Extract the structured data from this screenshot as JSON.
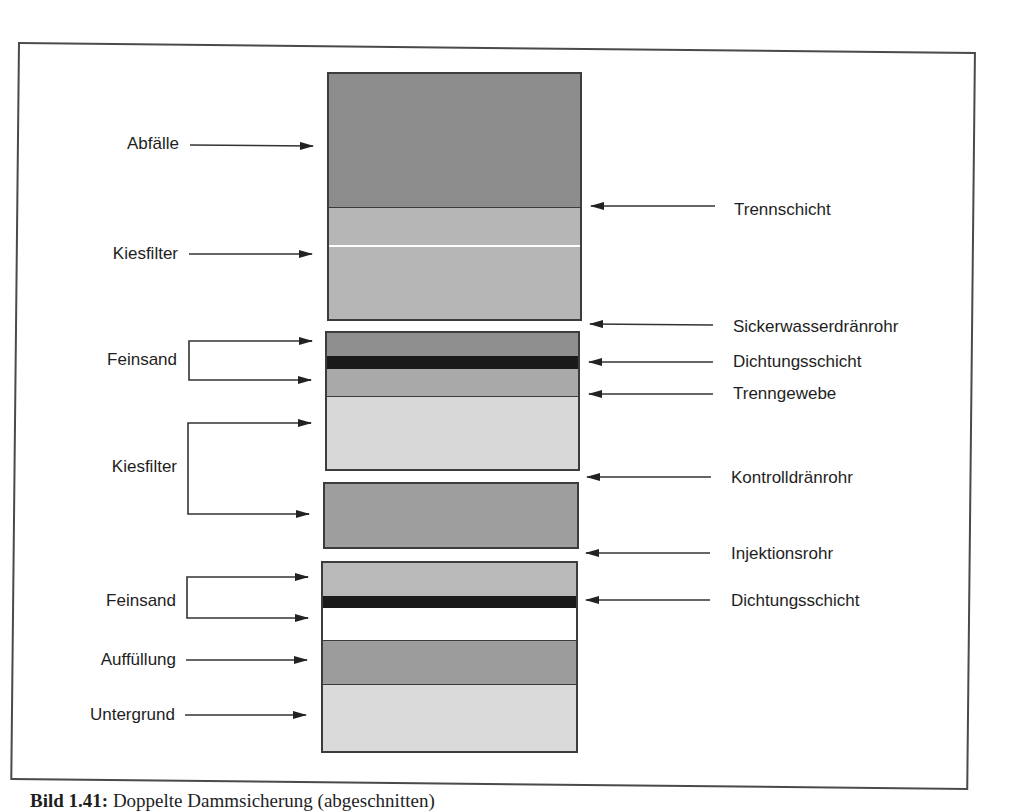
{
  "figure": {
    "caption_label": "Bild 1.41:",
    "caption_text": "Doppelte Dammsicherung (abgeschnitten)"
  },
  "left_labels": {
    "abfaelle": "Abfälle",
    "kiesfilter_1": "Kiesfilter",
    "feinsand_1": "Feinsand",
    "kiesfilter_2": "Kiesfilter",
    "feinsand_2": "Feinsand",
    "auffuellung": "Auffüllung",
    "untergrund": "Untergrund"
  },
  "right_labels": {
    "trennschicht": "Trennschicht",
    "sickerwasserdraenrohr": "Sickerwasserdränrohr",
    "dichtungsschicht_1": "Dichtungsschicht",
    "trenngewebe": "Trenngewebe",
    "kontrolldraenrohr": "Kontrolldränrohr",
    "injektionsrohr": "Injektionsrohr",
    "dichtungsschicht_2": "Dichtungsschicht"
  },
  "layers": [
    {
      "name": "Abfälle",
      "color": "#8c8c8c"
    },
    {
      "name": "Kiesfilter",
      "color": "#b6b6b6"
    },
    {
      "name": "Feinsand",
      "color": "#8f8f8f"
    },
    {
      "name": "Dichtungsschicht",
      "color": "#1a1a1a"
    },
    {
      "name": "Feinsand",
      "color": "#a9a9a9"
    },
    {
      "name": "Kiesfilter",
      "color": "#d8d8d8"
    },
    {
      "name": "Kiesfilter",
      "color": "#9e9e9e"
    },
    {
      "name": "Feinsand",
      "color": "#b9b9b9"
    },
    {
      "name": "Dichtungsschicht",
      "color": "#1a1a1a"
    },
    {
      "name": "Feinsand",
      "color": "#ffffff"
    },
    {
      "name": "Auffüllung",
      "color": "#9c9c9c"
    },
    {
      "name": "Untergrund",
      "color": "#dadada"
    }
  ]
}
